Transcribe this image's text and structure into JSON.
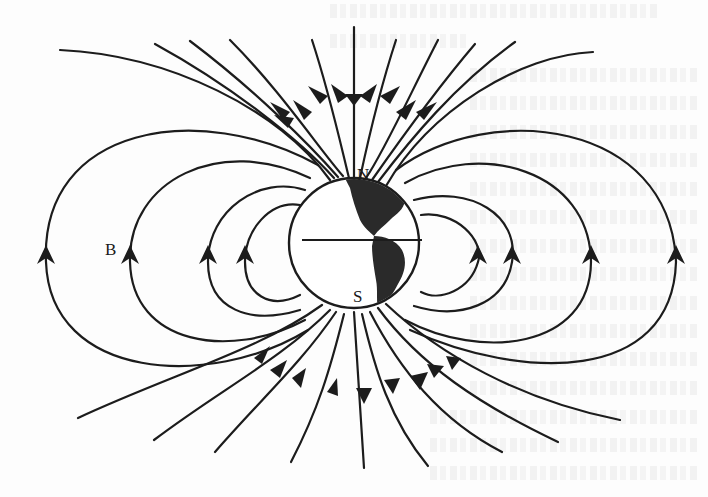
{
  "figure": {
    "labels": {
      "north_pole": "N",
      "south_pole": "S",
      "field": "B"
    },
    "colors": {
      "ink": "#1c1c1c",
      "globe_fill": "#ffffff",
      "continents": "#2a2a2a",
      "paper": "#fdfdfd"
    },
    "elements": {
      "globe": {
        "cx": 354,
        "cy": 243,
        "r": 65
      },
      "equator": {
        "x1": 302,
        "x2": 422,
        "y": 240
      },
      "closed_loops_per_side": 4,
      "north_inflowing_lines": 14,
      "south_outflowing_lines": 12
    }
  }
}
